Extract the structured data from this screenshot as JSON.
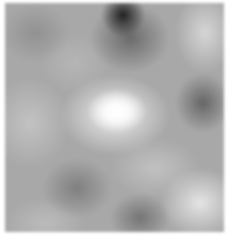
{
  "image": {
    "description": "Grayscale cloud/Perlin noise texture",
    "width": 230,
    "height": 239,
    "colors": {
      "background": "#ffffff",
      "base_gray": "#a8a8a8",
      "darkest": "#191919",
      "brightest": "#ffffff"
    }
  }
}
